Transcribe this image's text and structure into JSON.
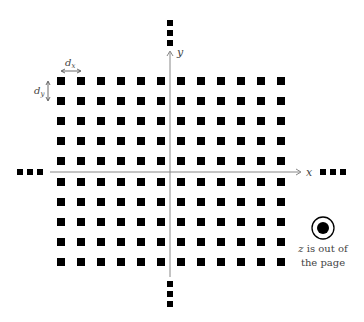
{
  "diagram": {
    "grid": {
      "columns": 12,
      "rows": 10,
      "x_start": 57,
      "y_start": 77,
      "pitch": 20,
      "square_size": 8,
      "color": "#000000"
    },
    "axes": {
      "x_label": "x",
      "y_label": "y",
      "axis_color": "#888888",
      "origin": [
        170,
        172
      ]
    },
    "spacing_labels": {
      "dx": "d",
      "dx_sub": "x",
      "dy": "d",
      "dy_sub": "y"
    },
    "continuation": "...",
    "z_note": {
      "line1": "z is out of",
      "line1_var": "z",
      "line1_rest": " is out of",
      "line2": "the page",
      "icon": "out-of-page-icon"
    }
  }
}
